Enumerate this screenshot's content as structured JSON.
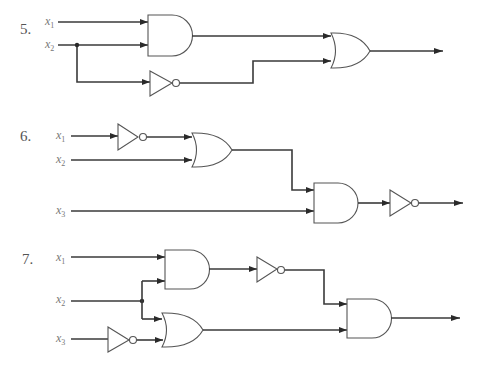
{
  "colors": {
    "wire": "#3a3a3a",
    "gate": "#555555",
    "label": "#777777",
    "background": "#ffffff"
  },
  "circuits": [
    {
      "number": "5.",
      "inputs": [
        {
          "var": "x",
          "sub": "1"
        },
        {
          "var": "x",
          "sub": "2"
        }
      ],
      "gates": [
        "AND(x1,x2)",
        "NOT(x2)",
        "OR(AND, NOT)"
      ],
      "output": "arrow"
    },
    {
      "number": "6.",
      "inputs": [
        {
          "var": "x",
          "sub": "1"
        },
        {
          "var": "x",
          "sub": "2"
        },
        {
          "var": "x",
          "sub": "3"
        }
      ],
      "gates": [
        "NOT(x1)",
        "OR(NOT x1, x2)",
        "AND(OR, x3)",
        "NOT(AND)"
      ],
      "output": "arrow"
    },
    {
      "number": "7.",
      "inputs": [
        {
          "var": "x",
          "sub": "1"
        },
        {
          "var": "x",
          "sub": "2"
        },
        {
          "var": "x",
          "sub": "3"
        }
      ],
      "gates": [
        "AND(x1,x2)",
        "NOT(AND)",
        "NOT(x3)",
        "OR(x2, NOT x3)",
        "AND(NOT, OR)"
      ],
      "output": "arrow"
    }
  ]
}
